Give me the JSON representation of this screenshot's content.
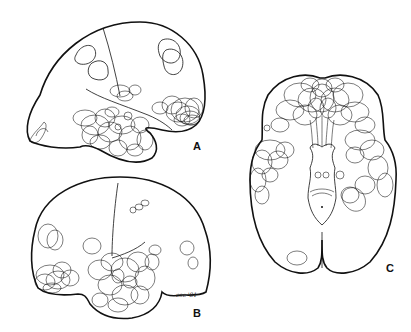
{
  "figure": {
    "stroke_color": "#111111",
    "background": "#ffffff",
    "panels": [
      {
        "id": "A",
        "label": "A",
        "view": "lateral view of hemisphere (left-facing frontal, temporal lobe dense clustering)"
      },
      {
        "id": "B",
        "label": "B",
        "view": "lateral view of opposite hemisphere with dense temporal clustering"
      },
      {
        "id": "C",
        "label": "C",
        "view": "basal/inferior view of brain with dense frontal and temporal clustering"
      }
    ],
    "signature": "esc '81"
  }
}
